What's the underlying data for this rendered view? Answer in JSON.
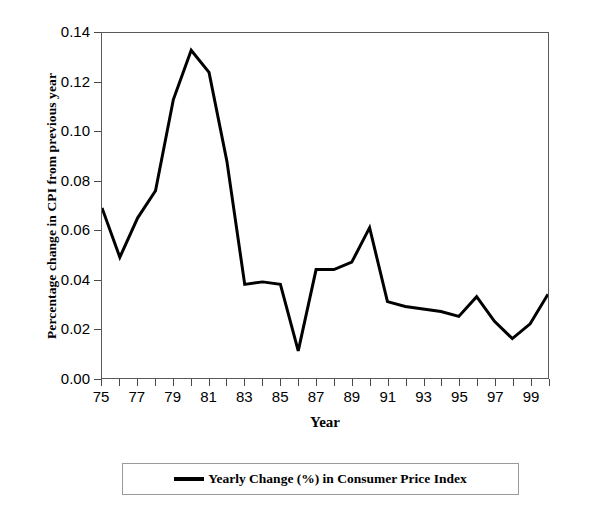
{
  "chart_data": {
    "type": "line",
    "title": "",
    "xlabel": "Year",
    "ylabel": "Percentage change in CPI from previous year",
    "xlim": [
      1975,
      2000
    ],
    "ylim": [
      0.0,
      0.14
    ],
    "grid": false,
    "legend_position": "bottom",
    "x_tick_labels": [
      "75",
      "77",
      "79",
      "81",
      "83",
      "85",
      "87",
      "89",
      "91",
      "93",
      "95",
      "97",
      "99"
    ],
    "x_tick_values": [
      1975,
      1977,
      1979,
      1981,
      1983,
      1985,
      1987,
      1989,
      1991,
      1993,
      1995,
      1997,
      1999
    ],
    "x_minor_ticks": [
      1976,
      1978,
      1980,
      1982,
      1984,
      1986,
      1988,
      1990,
      1992,
      1994,
      1996,
      1998,
      2000
    ],
    "y_tick_labels": [
      "0.14",
      "0.12",
      "0.10",
      "0.08",
      "0.06",
      "0.04",
      "0.02",
      "0.00"
    ],
    "y_tick_values": [
      0.14,
      0.12,
      0.1,
      0.08,
      0.06,
      0.04,
      0.02,
      0.0
    ],
    "series": [
      {
        "name": "Yearly Change (%) in Consumer Price Index",
        "color": "#000000",
        "line_width": 3,
        "x": [
          1975,
          1976,
          1977,
          1978,
          1979,
          1980,
          1981,
          1982,
          1983,
          1984,
          1985,
          1986,
          1987,
          1988,
          1989,
          1990,
          1991,
          1992,
          1993,
          1994,
          1995,
          1996,
          1997,
          1998,
          1999,
          2000
        ],
        "values": [
          0.069,
          0.049,
          0.065,
          0.076,
          0.113,
          0.133,
          0.124,
          0.088,
          0.038,
          0.039,
          0.038,
          0.011,
          0.044,
          0.044,
          0.047,
          0.061,
          0.031,
          0.029,
          0.028,
          0.027,
          0.025,
          0.033,
          0.023,
          0.016,
          0.022,
          0.034
        ]
      }
    ]
  },
  "axis": {
    "y_title": "Percentage change in CPI from previous year",
    "x_title": "Year"
  },
  "legend": {
    "swatch": "line-swatch",
    "label": "Yearly Change (%) in Consumer Price Index"
  }
}
